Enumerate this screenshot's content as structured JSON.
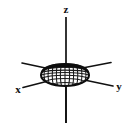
{
  "figure": {
    "type": "diagram",
    "background_color": "#ffffff",
    "ink_color": "#111111"
  },
  "axes": {
    "z": {
      "label": "z",
      "orientation": "vertical",
      "label_x": 66,
      "label_y": 13,
      "line": {
        "x1": 66,
        "y1": 17,
        "x2": 66,
        "y2": 123
      }
    },
    "y": {
      "label": "y",
      "orientation": "diagonal-down-right",
      "label_x": 119,
      "label_y": 89,
      "line_positive": {
        "x1": 70,
        "y1": 76,
        "x2": 113,
        "y2": 86
      },
      "line_negative": {
        "x1": 62,
        "y1": 72,
        "x2": 22,
        "y2": 63
      }
    },
    "x": {
      "label": "x",
      "orientation": "diagonal-down-left",
      "label_x": 18,
      "label_y": 92,
      "line_positive": {
        "x1": 62,
        "y1": 78,
        "x2": 22,
        "y2": 88
      },
      "line_negative": {
        "x1": 72,
        "y1": 70,
        "x2": 112,
        "y2": 62
      }
    }
  },
  "body": {
    "name": "oblate-spheroid",
    "shape": "flattened ellipsoid",
    "center_x": 65,
    "center_y": 75,
    "semi_axis_horizontal": 24,
    "semi_axis_vertical": 11,
    "surface": "wireframe mesh",
    "mesh_meridians": 13,
    "mesh_parallels": 4,
    "rim_style": "thick dark band on upper edge",
    "fill_color": "#ffffff",
    "outline_color": "#0d0d0d"
  }
}
